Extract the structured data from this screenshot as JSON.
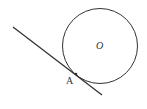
{
  "diagram": {
    "type": "geometry-tangent-line",
    "colors": {
      "stroke": "#333333",
      "background": "#ffffff"
    },
    "circle": {
      "center_label": "O",
      "cx": 100,
      "cy": 46,
      "r": 37.5
    },
    "tangent_line": {
      "x1": 13,
      "y1": 27,
      "x2": 102,
      "y2": 95
    },
    "point": {
      "label": "A",
      "x": 76,
      "y": 74
    }
  }
}
